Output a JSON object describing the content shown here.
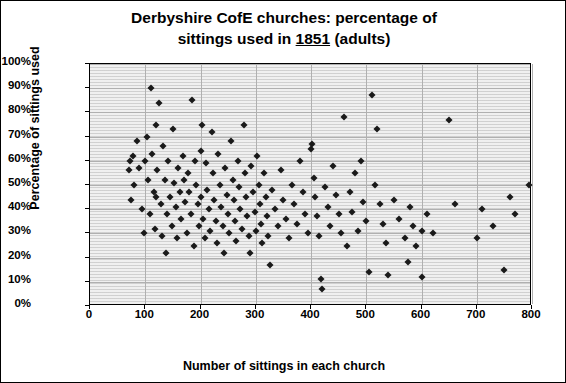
{
  "chart_data": {
    "type": "scatter",
    "title_line1": "Derbyshire CofE churches: percentage of",
    "title_line2_pre": "sittings used in ",
    "title_year": "1851",
    "title_line2_post": " (adults)",
    "xlabel": "Number of sittings in each church",
    "ylabel": "Percentage of sittings  used",
    "xlim": [
      0,
      800
    ],
    "ylim": [
      0,
      1.0
    ],
    "xticks": [
      "0",
      "100",
      "200",
      "300",
      "400",
      "500",
      "600",
      "700",
      "800"
    ],
    "yticks": [
      "0%",
      "10%",
      "20%",
      "30%",
      "40%",
      "50%",
      "60%",
      "70%",
      "80%",
      "90%",
      "100%"
    ],
    "grid": "horizontal-and-vertical",
    "legend": "none",
    "marker": "black diamond",
    "plot_background": "#f0f0f0",
    "points": [
      [
        70,
        56
      ],
      [
        72,
        60
      ],
      [
        75,
        44
      ],
      [
        78,
        62
      ],
      [
        80,
        50
      ],
      [
        85,
        68
      ],
      [
        88,
        57
      ],
      [
        95,
        40
      ],
      [
        98,
        30
      ],
      [
        100,
        60
      ],
      [
        103,
        70
      ],
      [
        105,
        52
      ],
      [
        108,
        38
      ],
      [
        110,
        90
      ],
      [
        112,
        63
      ],
      [
        115,
        47
      ],
      [
        118,
        32
      ],
      [
        120,
        75
      ],
      [
        120,
        45
      ],
      [
        122,
        56
      ],
      [
        125,
        84
      ],
      [
        128,
        42
      ],
      [
        130,
        29
      ],
      [
        132,
        66
      ],
      [
        135,
        52
      ],
      [
        138,
        22
      ],
      [
        140,
        38
      ],
      [
        142,
        60
      ],
      [
        145,
        45
      ],
      [
        148,
        33
      ],
      [
        150,
        73
      ],
      [
        152,
        51
      ],
      [
        155,
        41
      ],
      [
        158,
        28
      ],
      [
        160,
        57
      ],
      [
        162,
        47
      ],
      [
        165,
        36
      ],
      [
        168,
        62
      ],
      [
        170,
        52
      ],
      [
        172,
        43
      ],
      [
        175,
        30
      ],
      [
        178,
        55
      ],
      [
        180,
        47
      ],
      [
        182,
        38
      ],
      [
        185,
        85
      ],
      [
        188,
        25
      ],
      [
        190,
        60
      ],
      [
        192,
        50
      ],
      [
        195,
        42
      ],
      [
        198,
        33
      ],
      [
        200,
        64
      ],
      [
        200,
        45
      ],
      [
        202,
        75
      ],
      [
        205,
        36
      ],
      [
        208,
        28
      ],
      [
        210,
        59
      ],
      [
        212,
        48
      ],
      [
        215,
        40
      ],
      [
        218,
        31
      ],
      [
        220,
        72
      ],
      [
        222,
        55
      ],
      [
        225,
        44
      ],
      [
        228,
        35
      ],
      [
        230,
        26
      ],
      [
        232,
        63
      ],
      [
        235,
        50
      ],
      [
        238,
        41
      ],
      [
        240,
        33
      ],
      [
        242,
        22
      ],
      [
        245,
        57
      ],
      [
        248,
        46
      ],
      [
        250,
        38
      ],
      [
        252,
        30
      ],
      [
        255,
        68
      ],
      [
        258,
        52
      ],
      [
        260,
        44
      ],
      [
        262,
        35
      ],
      [
        265,
        27
      ],
      [
        268,
        60
      ],
      [
        270,
        49
      ],
      [
        272,
        40
      ],
      [
        275,
        32
      ],
      [
        278,
        75
      ],
      [
        280,
        55
      ],
      [
        282,
        45
      ],
      [
        285,
        37
      ],
      [
        288,
        29
      ],
      [
        290,
        22
      ],
      [
        292,
        58
      ],
      [
        295,
        47
      ],
      [
        298,
        39
      ],
      [
        300,
        31
      ],
      [
        302,
        62
      ],
      [
        305,
        50
      ],
      [
        308,
        42
      ],
      [
        310,
        34
      ],
      [
        312,
        26
      ],
      [
        315,
        55
      ],
      [
        318,
        45
      ],
      [
        320,
        37
      ],
      [
        322,
        29
      ],
      [
        325,
        17
      ],
      [
        330,
        48
      ],
      [
        335,
        40
      ],
      [
        340,
        33
      ],
      [
        345,
        56
      ],
      [
        350,
        44
      ],
      [
        355,
        36
      ],
      [
        360,
        28
      ],
      [
        365,
        50
      ],
      [
        370,
        42
      ],
      [
        375,
        34
      ],
      [
        380,
        60
      ],
      [
        385,
        47
      ],
      [
        390,
        38
      ],
      [
        395,
        30
      ],
      [
        400,
        65
      ],
      [
        402,
        67
      ],
      [
        405,
        53
      ],
      [
        408,
        45
      ],
      [
        410,
        37
      ],
      [
        415,
        29
      ],
      [
        418,
        11
      ],
      [
        420,
        7
      ],
      [
        425,
        49
      ],
      [
        430,
        41
      ],
      [
        435,
        33
      ],
      [
        440,
        58
      ],
      [
        445,
        46
      ],
      [
        450,
        38
      ],
      [
        455,
        30
      ],
      [
        460,
        78
      ],
      [
        465,
        25
      ],
      [
        470,
        47
      ],
      [
        475,
        39
      ],
      [
        480,
        55
      ],
      [
        485,
        31
      ],
      [
        490,
        60
      ],
      [
        495,
        43
      ],
      [
        500,
        35
      ],
      [
        505,
        14
      ],
      [
        510,
        87
      ],
      [
        515,
        50
      ],
      [
        520,
        73
      ],
      [
        525,
        42
      ],
      [
        530,
        34
      ],
      [
        535,
        26
      ],
      [
        540,
        13
      ],
      [
        550,
        44
      ],
      [
        560,
        36
      ],
      [
        570,
        28
      ],
      [
        575,
        18
      ],
      [
        580,
        41
      ],
      [
        585,
        33
      ],
      [
        590,
        25
      ],
      [
        600,
        31
      ],
      [
        600,
        12
      ],
      [
        610,
        38
      ],
      [
        620,
        30
      ],
      [
        650,
        77
      ],
      [
        660,
        42
      ],
      [
        700,
        28
      ],
      [
        710,
        40
      ],
      [
        730,
        33
      ],
      [
        750,
        15
      ],
      [
        760,
        45
      ],
      [
        770,
        38
      ],
      [
        795,
        50
      ]
    ]
  }
}
